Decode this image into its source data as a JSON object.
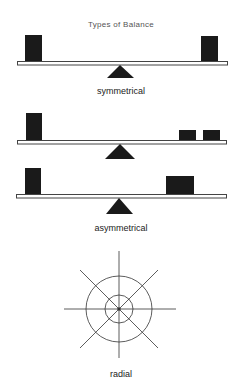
{
  "title": "Types of Balance",
  "colors": {
    "block": "#1a1a1a",
    "beam_stroke": "#444444",
    "beam_fill": "#ffffff",
    "line": "#333333"
  },
  "diagrams": [
    {
      "label": "symmetrical"
    },
    {
      "label": ""
    },
    {
      "label": "asymmetrical"
    },
    {
      "label": "radial"
    }
  ]
}
